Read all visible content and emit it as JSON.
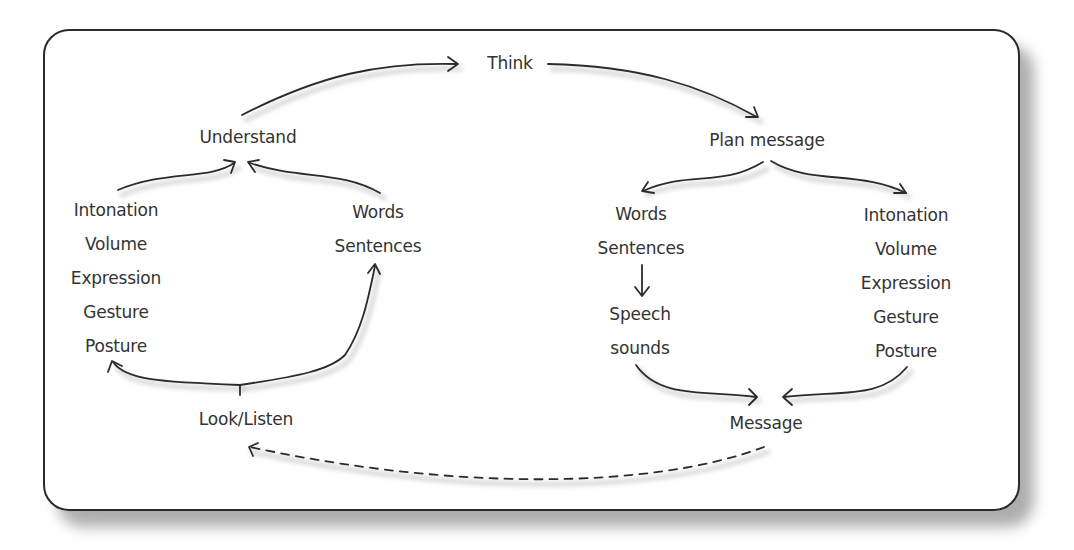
{
  "diagram": {
    "type": "communication-cycle",
    "nodes": {
      "think": "Think",
      "understand": "Understand",
      "plan_message": "Plan message",
      "look_listen": "Look/Listen",
      "message": "Message"
    },
    "receive_nonverbal": [
      "Intonation",
      "Volume",
      "Expression",
      "Gesture",
      "Posture"
    ],
    "receive_verbal": [
      "Words",
      "Sentences"
    ],
    "send_verbal": [
      "Words",
      "Sentences"
    ],
    "send_speech": [
      "Speech",
      "sounds"
    ],
    "send_nonverbal": [
      "Intonation",
      "Volume",
      "Expression",
      "Gesture",
      "Posture"
    ],
    "edges": [
      {
        "from": "Understand",
        "to": "Think",
        "style": "solid"
      },
      {
        "from": "Think",
        "to": "Plan message",
        "style": "solid"
      },
      {
        "from": "Plan message",
        "to": "Words/Sentences",
        "style": "solid"
      },
      {
        "from": "Plan message",
        "to": "Intonation/Volume/Expression/Gesture/Posture",
        "style": "solid"
      },
      {
        "from": "Sentences",
        "to": "Speech sounds",
        "style": "solid"
      },
      {
        "from": "Speech sounds",
        "to": "Message",
        "style": "solid"
      },
      {
        "from": "Posture",
        "to": "Message",
        "style": "solid"
      },
      {
        "from": "Message",
        "to": "Look/Listen",
        "style": "dashed"
      },
      {
        "from": "Look/Listen",
        "to": "Posture",
        "style": "solid"
      },
      {
        "from": "Look/Listen",
        "to": "Sentences",
        "style": "solid"
      },
      {
        "from": "Intonation",
        "to": "Understand",
        "style": "solid"
      },
      {
        "from": "Words",
        "to": "Understand",
        "style": "solid"
      }
    ]
  }
}
